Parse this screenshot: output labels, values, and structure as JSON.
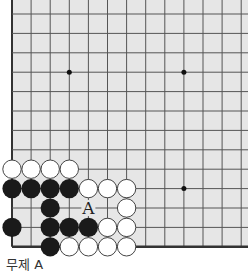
{
  "diagram": {
    "type": "go-board-fragment",
    "origin": {
      "x": 12,
      "y": 14
    },
    "spacing": {
      "x": 19.1,
      "y": 19.4
    },
    "columns": 13,
    "rows": 13,
    "edges": {
      "left": true,
      "bottom": true,
      "top": false,
      "right": false
    },
    "colors": {
      "board": "#e6e6e6",
      "line": "#555555",
      "edge": "#333333",
      "black": "#1a1a1a",
      "white": "#ffffff"
    },
    "hoshi": [
      [
        3,
        3
      ],
      [
        9,
        3
      ],
      [
        9,
        9
      ]
    ],
    "stones": {
      "white": [
        [
          0,
          8
        ],
        [
          1,
          8
        ],
        [
          2,
          8
        ],
        [
          3,
          8
        ],
        [
          4,
          9
        ],
        [
          5,
          9
        ],
        [
          6,
          9
        ],
        [
          6,
          10
        ],
        [
          5,
          11
        ],
        [
          6,
          11
        ],
        [
          3,
          12
        ],
        [
          4,
          12
        ],
        [
          5,
          12
        ],
        [
          6,
          12
        ]
      ],
      "black": [
        [
          0,
          9
        ],
        [
          1,
          9
        ],
        [
          2,
          9
        ],
        [
          3,
          9
        ],
        [
          2,
          10
        ],
        [
          0,
          11
        ],
        [
          2,
          11
        ],
        [
          3,
          11
        ],
        [
          4,
          11
        ],
        [
          2,
          12
        ]
      ]
    },
    "labels": [
      {
        "col": 4,
        "row": 10,
        "text": "A"
      }
    ]
  },
  "caption": "무제 A"
}
